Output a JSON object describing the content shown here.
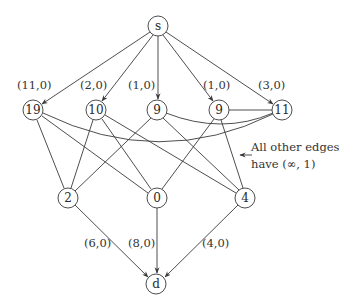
{
  "diagram": {
    "type": "flow-network",
    "nodes": [
      {
        "id": "s",
        "label": "s",
        "x": 158,
        "y": 26
      },
      {
        "id": "n19",
        "label": "19",
        "x": 33,
        "y": 110
      },
      {
        "id": "n10",
        "label": "10",
        "x": 96,
        "y": 110
      },
      {
        "id": "n9a",
        "label": "9",
        "x": 157,
        "y": 110
      },
      {
        "id": "n9b",
        "label": "9",
        "x": 219,
        "y": 110
      },
      {
        "id": "n11",
        "label": "11",
        "x": 282,
        "y": 110
      },
      {
        "id": "n2",
        "label": "2",
        "x": 68,
        "y": 198
      },
      {
        "id": "n0",
        "label": "0",
        "x": 157,
        "y": 198
      },
      {
        "id": "n4",
        "label": "4",
        "x": 245,
        "y": 198
      },
      {
        "id": "d",
        "label": "d",
        "x": 156,
        "y": 284
      }
    ],
    "labeled_edges": [
      {
        "from": "s",
        "to": "n19",
        "label": "(11,0)",
        "lx": 17,
        "ly": 89
      },
      {
        "from": "s",
        "to": "n10",
        "label": "(2,0)",
        "lx": 80,
        "ly": 89
      },
      {
        "from": "s",
        "to": "n9a",
        "label": "(1,0)",
        "lx": 128,
        "ly": 89
      },
      {
        "from": "s",
        "to": "n9b",
        "label": "(1,0)",
        "lx": 203,
        "ly": 89
      },
      {
        "from": "s",
        "to": "n11",
        "label": "(3,0)",
        "lx": 258,
        "ly": 89
      },
      {
        "from": "n2",
        "to": "d",
        "label": "(6,0)",
        "lx": 84,
        "ly": 247
      },
      {
        "from": "n0",
        "to": "d",
        "label": "(8,0)",
        "lx": 128,
        "ly": 247
      },
      {
        "from": "n4",
        "to": "d",
        "label": "(4,0)",
        "lx": 202,
        "ly": 247
      }
    ],
    "other_edges": [
      {
        "from": "n19",
        "to": "n2"
      },
      {
        "from": "n19",
        "to": "n0"
      },
      {
        "from": "n19",
        "to": "n11",
        "curved": true
      },
      {
        "from": "n10",
        "to": "n2"
      },
      {
        "from": "n10",
        "to": "n0"
      },
      {
        "from": "n10",
        "to": "n4"
      },
      {
        "from": "n9a",
        "to": "n2"
      },
      {
        "from": "n9a",
        "to": "n4"
      },
      {
        "from": "n9a",
        "to": "n11",
        "curved": true
      },
      {
        "from": "n9b",
        "to": "n0"
      },
      {
        "from": "n9b",
        "to": "n4"
      },
      {
        "from": "n9b",
        "to": "n11"
      }
    ],
    "note": {
      "line1": "All other edges",
      "line2": "have (∞, 1)"
    }
  }
}
